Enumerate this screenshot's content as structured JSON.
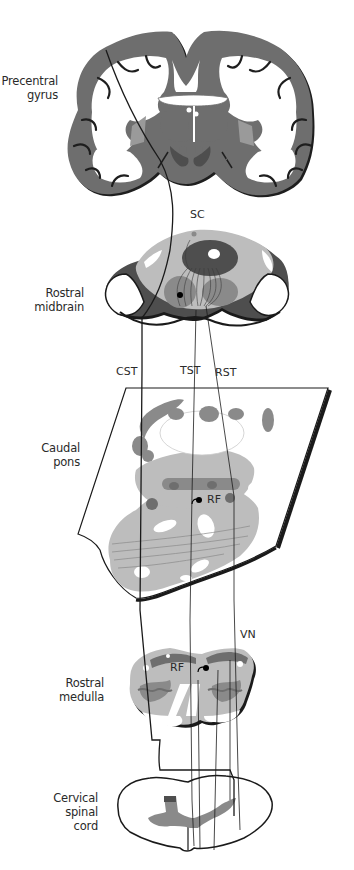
{
  "diagram": {
    "type": "neuroanatomical-pathway",
    "levels": [
      {
        "id": "precentral-gyrus",
        "label_line1": "Precentral",
        "label_line2": "gyrus"
      },
      {
        "id": "rostral-midbrain",
        "label_line1": "Rostral",
        "label_line2": "midbrain"
      },
      {
        "id": "caudal-pons",
        "label_line1": "Caudal",
        "label_line2": "pons"
      },
      {
        "id": "rostral-medulla",
        "label_line1": "Rostral",
        "label_line2": "medulla"
      },
      {
        "id": "cervical-spinal-cord",
        "label_line1": "Cervical",
        "label_line2": "spinal",
        "label_line3": "cord"
      }
    ],
    "structure_tags": {
      "sc": "SC",
      "cst": "CST",
      "tst": "TST",
      "rst": "RST",
      "rf_pons": "RF",
      "rf_medulla": "RF",
      "vn": "VN"
    },
    "colors": {
      "cortex": "#6e6e6e",
      "cortex_shadow": "#1e1e1e",
      "tissue_light": "#bdbdbd",
      "tissue_mid": "#8a8a8a",
      "tissue_dark": "#4e4e4e",
      "outline": "#1a1a1a",
      "background": "#ffffff"
    }
  }
}
